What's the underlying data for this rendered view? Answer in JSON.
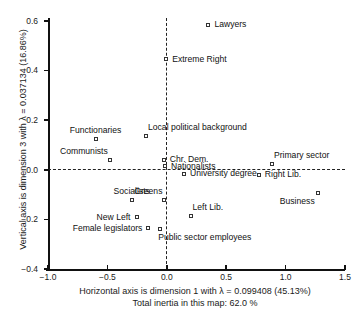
{
  "chart_data": {
    "type": "scatter",
    "title": "",
    "xlabel": "Horizontal axis is dimension 1 with λ = 0.099408 (45.13%)",
    "ylabel": "Vertical axis is dimension 3 with λ = 0.037134 (16.86%)",
    "subtitle": "Total inertia in this map: 62.0 %",
    "xlim": [
      -1.0,
      1.5
    ],
    "ylim": [
      -0.4,
      0.6
    ],
    "xticks": [
      "−1.0",
      "−0.5",
      "0.0",
      "0.5",
      "1.0",
      "1.5"
    ],
    "xtick_values": [
      -1.0,
      -0.5,
      0.0,
      0.5,
      1.0,
      1.5
    ],
    "yticks": [
      "0.6",
      "0.4",
      "0.2",
      "0.0",
      "−0.2",
      "−0.4"
    ],
    "ytick_values": [
      0.6,
      0.4,
      0.2,
      0.0,
      -0.2,
      -0.4
    ],
    "grid": false,
    "legend": "none",
    "reference_lines": [
      {
        "axis": "vertical",
        "value": 0.0,
        "style": "dashed"
      },
      {
        "axis": "horizontal",
        "value": 0.0,
        "style": "dashed"
      }
    ],
    "points": [
      {
        "label": "Lawyers",
        "x": 0.35,
        "y": 0.585,
        "label_pos": "right"
      },
      {
        "label": "Extreme Right",
        "x": -0.005,
        "y": 0.445,
        "label_pos": "right"
      },
      {
        "label": "Functionaries",
        "x": -0.6,
        "y": 0.125,
        "label_pos": "above"
      },
      {
        "label": "Communists",
        "x": -0.48,
        "y": 0.04,
        "label_pos": "above-left"
      },
      {
        "label": "Local political background",
        "x": -0.175,
        "y": 0.135,
        "label_pos": "above-right"
      },
      {
        "label": "Chr. Dem.",
        "x": -0.025,
        "y": 0.04,
        "label_pos": "right"
      },
      {
        "label": "Nationalists",
        "x": -0.015,
        "y": 0.015,
        "label_pos": "right"
      },
      {
        "label": "Primary sector",
        "x": 0.885,
        "y": 0.025,
        "label_pos": "above-right"
      },
      {
        "label": "Right Lib.",
        "x": 0.775,
        "y": -0.02,
        "label_pos": "right"
      },
      {
        "label": "University degree",
        "x": 0.145,
        "y": -0.015,
        "label_pos": "right"
      },
      {
        "label": "Socialists",
        "x": -0.295,
        "y": -0.12,
        "label_pos": "above"
      },
      {
        "label": "Greens",
        "x": -0.02,
        "y": -0.12,
        "label_pos": "above-left"
      },
      {
        "label": "Business",
        "x": 1.27,
        "y": -0.095,
        "label_pos": "below-left"
      },
      {
        "label": "New Left",
        "x": -0.255,
        "y": -0.192,
        "label_pos": "left"
      },
      {
        "label": "Female legislators",
        "x": -0.155,
        "y": -0.235,
        "label_pos": "left"
      },
      {
        "label": "Left Lib.",
        "x": 0.2,
        "y": -0.185,
        "label_pos": "above-right"
      },
      {
        "label": "Public sector employees",
        "x": -0.055,
        "y": -0.24,
        "label_pos": "below-right"
      }
    ]
  },
  "axis": {
    "y_title": "Vertical axis is dimension 3 with λ = 0.037134 (16.86%)",
    "x_title": "Horizontal axis is dimension 1 with λ = 0.099408 (45.13%)",
    "inertia_note": "Total inertia in this map: 62.0 %"
  },
  "footer": {
    "cropped_text": ""
  }
}
